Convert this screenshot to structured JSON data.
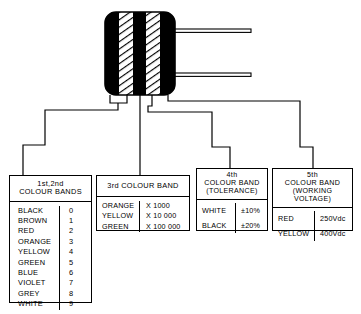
{
  "component": {
    "name": "resistor-colour-band-diagram",
    "body_label": "banded resistor body",
    "bands": [
      {
        "index": 1,
        "fill": "black"
      },
      {
        "index": 2,
        "fill": "hatched"
      },
      {
        "index": 3,
        "fill": "black"
      },
      {
        "index": 4,
        "fill": "hatched"
      },
      {
        "index": 5,
        "fill": "black"
      }
    ],
    "leads": 2,
    "colors": {
      "band_dark": "#000000",
      "body_outline": "#000000",
      "background": "#ffffff"
    }
  },
  "tables": [
    {
      "id": "first-second-colour-bands",
      "title_lines": [
        "1st,2nd",
        "COLOUR BANDS"
      ],
      "rows": [
        {
          "colour": "BLACK",
          "value": "0"
        },
        {
          "colour": "BROWN",
          "value": "1"
        },
        {
          "colour": "RED",
          "value": "2"
        },
        {
          "colour": "ORANGE",
          "value": "3"
        },
        {
          "colour": "YELLOW",
          "value": "4"
        },
        {
          "colour": "GREEN",
          "value": "5"
        },
        {
          "colour": "BLUE",
          "value": "6"
        },
        {
          "colour": "VIOLET",
          "value": "7"
        },
        {
          "colour": "GREY",
          "value": "8"
        },
        {
          "colour": "WHITE",
          "value": "9"
        }
      ]
    },
    {
      "id": "third-colour-band",
      "title_lines": [
        "3rd COLOUR BAND"
      ],
      "rows": [
        {
          "colour": "ORANGE",
          "value": "X 1000"
        },
        {
          "colour": "YELLOW",
          "value": "X 10 000"
        },
        {
          "colour": "GREEN",
          "value": "X 100 000"
        }
      ]
    },
    {
      "id": "fourth-colour-band",
      "title_lines": [
        "4th",
        "COLOUR BAND",
        "(TOLERANCE)"
      ],
      "rows": [
        {
          "colour": "WHITE",
          "value": "±10%"
        },
        {
          "colour": "BLACK",
          "value": "±20%"
        }
      ]
    },
    {
      "id": "fifth-colour-band",
      "title_lines": [
        "5th",
        "COLOUR BAND",
        "(WORKING VOLTAGE)"
      ],
      "rows": [
        {
          "colour": "RED",
          "value": "250Vdc"
        },
        {
          "colour": "YELLOW",
          "value": "400Vdc"
        }
      ]
    }
  ]
}
